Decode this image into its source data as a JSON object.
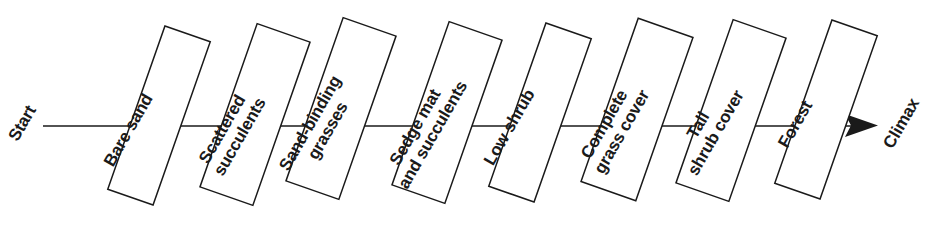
{
  "diagram": {
    "type": "succession-flow",
    "orientation": "left-to-right",
    "background_color": "#ffffff",
    "stroke_color": "#1a1a1a",
    "box_rotation_degrees": 19.3,
    "label_rotation_degrees": -60,
    "axis_y": 126,
    "start_label": "Start",
    "end_label": "Climax",
    "stages": [
      {
        "index": 1,
        "label": "Bare sand",
        "lines": [
          "Bare sand"
        ],
        "box": {
          "x": 135,
          "y": 29,
          "width": 48,
          "height": 173
        }
      },
      {
        "index": 2,
        "label": "Scattered succulents",
        "lines": [
          "Scattered",
          "succulents"
        ],
        "box": {
          "x": 227,
          "y": 28,
          "width": 56,
          "height": 173
        }
      },
      {
        "index": 3,
        "label": "Sand-binding grasses",
        "lines": [
          "Sand-binding",
          "grasses"
        ],
        "box": {
          "x": 313,
          "y": 22,
          "width": 56,
          "height": 173
        }
      },
      {
        "index": 4,
        "label": "Sedge mat and succulents",
        "lines": [
          "Sedge mat",
          "and succulents"
        ],
        "box": {
          "x": 419,
          "y": 26,
          "width": 56,
          "height": 173
        }
      },
      {
        "index": 5,
        "label": "Low shrub",
        "lines": [
          "Low shrub"
        ],
        "box": {
          "x": 516,
          "y": 26,
          "width": 48,
          "height": 173
        }
      },
      {
        "index": 6,
        "label": "Complete grass cover",
        "lines": [
          "Complete",
          "grass cover"
        ],
        "box": {
          "x": 608,
          "y": 23,
          "width": 58,
          "height": 173
        }
      },
      {
        "index": 7,
        "label": "Tall shrub cover",
        "lines": [
          "Tall",
          "shrub cover"
        ],
        "box": {
          "x": 703,
          "y": 24,
          "width": 56,
          "height": 173
        }
      },
      {
        "index": 8,
        "label": "Forest",
        "lines": [
          "Forest"
        ],
        "box": {
          "x": 802,
          "y": 23,
          "width": 48,
          "height": 173
        }
      }
    ],
    "axis": {
      "line_start_x": 43,
      "line_end_x": 872,
      "arrow_tip_x": 878
    }
  }
}
